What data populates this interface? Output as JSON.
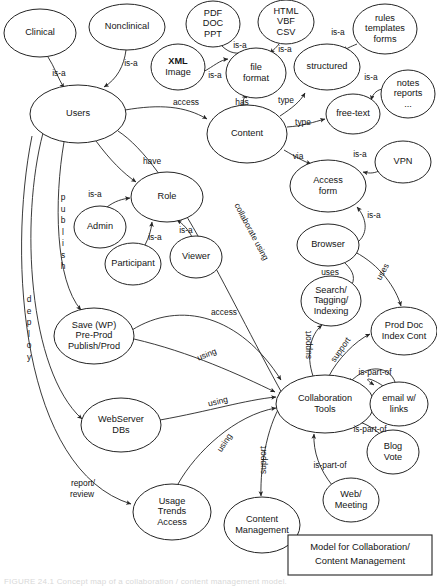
{
  "diagram": {
    "title": "Model for Collaboration/ Content Management",
    "caption_box": {
      "line1": "Model for Collaboration/",
      "line2": "Content Management"
    },
    "figure_caption": "FIGURE 24.1    Concept map of a collaboration / content management model.",
    "stroke_color": "#242424",
    "text_color": "#141414",
    "background_color": "#ffffff"
  },
  "nodes": [
    {
      "id": "clinical",
      "label": "Clinical",
      "lines": [
        "Clinical"
      ],
      "cx": 40,
      "cy": 33,
      "rx": 36,
      "ry": 24
    },
    {
      "id": "nonclinical",
      "label": "Nonclinical",
      "lines": [
        "Nonclinical"
      ],
      "cx": 127,
      "cy": 27,
      "rx": 38,
      "ry": 23
    },
    {
      "id": "pdf-doc-ppt",
      "label": "PDF DOC PPT",
      "lines": [
        "PDF",
        "DOC",
        "PPT"
      ],
      "cx": 213,
      "cy": 24,
      "rx": 27,
      "ry": 23
    },
    {
      "id": "html-vbf-csv",
      "label": "HTML VBF CSV",
      "lines": [
        "HTML",
        "VBF",
        "CSV"
      ],
      "cx": 286,
      "cy": 22,
      "rx": 28,
      "ry": 22
    },
    {
      "id": "rules-templates",
      "label": "rules templates forms",
      "lines": [
        "rules",
        "templates",
        "forms"
      ],
      "cx": 385,
      "cy": 29,
      "rx": 32,
      "ry": 25
    },
    {
      "id": "xml-image",
      "label": "XML Image",
      "lines": [
        "XML",
        "Image"
      ],
      "cx": 178,
      "cy": 67,
      "rx": 27,
      "ry": 23,
      "boldFirst": true
    },
    {
      "id": "file-format",
      "label": "file format",
      "lines": [
        "file",
        "format"
      ],
      "cx": 256,
      "cy": 73,
      "rx": 30,
      "ry": 25
    },
    {
      "id": "structured",
      "label": "structured",
      "lines": [
        "structured"
      ],
      "cx": 327,
      "cy": 67,
      "rx": 33,
      "ry": 23
    },
    {
      "id": "notes-reports",
      "label": "notes reports ...",
      "lines": [
        "notes",
        "reports",
        "..."
      ],
      "cx": 408,
      "cy": 94,
      "rx": 27,
      "ry": 24
    },
    {
      "id": "users",
      "label": "Users",
      "lines": [
        "Users"
      ],
      "cx": 78,
      "cy": 114,
      "rx": 48,
      "ry": 29
    },
    {
      "id": "content",
      "label": "Content",
      "lines": [
        "Content"
      ],
      "cx": 247,
      "cy": 134,
      "rx": 40,
      "ry": 29
    },
    {
      "id": "free-text",
      "label": "free-text",
      "lines": [
        "free-text"
      ],
      "cx": 353,
      "cy": 114,
      "rx": 27,
      "ry": 20
    },
    {
      "id": "vpn",
      "label": "VPN",
      "lines": [
        "VPN"
      ],
      "cx": 403,
      "cy": 162,
      "rx": 28,
      "ry": 21
    },
    {
      "id": "access-form",
      "label": "Access form",
      "lines": [
        "Access",
        "form"
      ],
      "cx": 328,
      "cy": 186,
      "rx": 38,
      "ry": 26
    },
    {
      "id": "role",
      "label": "Role",
      "lines": [
        "Role"
      ],
      "cx": 167,
      "cy": 197,
      "rx": 36,
      "ry": 25
    },
    {
      "id": "admin",
      "label": "Admin",
      "lines": [
        "Admin"
      ],
      "cx": 100,
      "cy": 227,
      "rx": 26,
      "ry": 21
    },
    {
      "id": "browser",
      "label": "Browser",
      "lines": [
        "Browser"
      ],
      "cx": 328,
      "cy": 245,
      "rx": 31,
      "ry": 21
    },
    {
      "id": "participant",
      "label": "Participant",
      "lines": [
        "Participant"
      ],
      "cx": 133,
      "cy": 264,
      "rx": 28,
      "ry": 21
    },
    {
      "id": "viewer",
      "label": "Viewer",
      "lines": [
        "Viewer"
      ],
      "cx": 196,
      "cy": 257,
      "rx": 26,
      "ry": 21
    },
    {
      "id": "search-tagging",
      "label": "Search/ Tagging/ Indexing",
      "lines": [
        "Search/",
        "Tagging/",
        "Indexing"
      ],
      "cx": 331,
      "cy": 301,
      "rx": 30,
      "ry": 25
    },
    {
      "id": "prod-doc-index",
      "label": "Prod Doc Index Cont",
      "lines": [
        "Prod Doc",
        "Index Cont"
      ],
      "cx": 404,
      "cy": 331,
      "rx": 33,
      "ry": 24
    },
    {
      "id": "save-wp",
      "label": "Save (WP) Pre-Prod Publish/Prod",
      "lines": [
        "Save (WP)",
        "Pre-Prod",
        "Publish/Prod"
      ],
      "cx": 94,
      "cy": 336,
      "rx": 40,
      "ry": 28
    },
    {
      "id": "collaboration",
      "label": "Collaboration Tools",
      "lines": [
        "Collaboration",
        "Tools"
      ],
      "cx": 325,
      "cy": 404,
      "rx": 49,
      "ry": 29
    },
    {
      "id": "email-links",
      "label": "email w/ links",
      "lines": [
        "email w/",
        "links"
      ],
      "cx": 399,
      "cy": 404,
      "rx": 29,
      "ry": 22
    },
    {
      "id": "webserver-dbs",
      "label": "WebServer DBs",
      "lines": [
        "WebServer",
        "DBs"
      ],
      "cx": 121,
      "cy": 425,
      "rx": 40,
      "ry": 27
    },
    {
      "id": "blog-vote",
      "label": "Blog Vote",
      "lines": [
        "Blog",
        "Vote"
      ],
      "cx": 393,
      "cy": 452,
      "rx": 26,
      "ry": 22
    },
    {
      "id": "web-meeting",
      "label": "Web/ Meeting",
      "lines": [
        "Web/",
        "Meeting"
      ],
      "cx": 351,
      "cy": 500,
      "rx": 28,
      "ry": 22
    },
    {
      "id": "usage-trends",
      "label": "Usage Trends Access",
      "lines": [
        "Usage",
        "Trends",
        "Access"
      ],
      "cx": 172,
      "cy": 512,
      "rx": 39,
      "ry": 28
    },
    {
      "id": "content-mgmt",
      "label": "Content Management",
      "lines": [
        "Content",
        "Management"
      ],
      "cx": 262,
      "cy": 525,
      "rx": 38,
      "ry": 28
    }
  ],
  "edges": [
    {
      "id": "clinical-users",
      "label": "is-a",
      "from": "clinical",
      "to": "users"
    },
    {
      "id": "nonclinical-users",
      "label": "is-a",
      "from": "nonclinical",
      "to": "users"
    },
    {
      "id": "pdf-fileformat",
      "label": "is-a",
      "from": "pdf-doc-ppt",
      "to": "file-format"
    },
    {
      "id": "html-fileformat",
      "label": "is-a",
      "from": "html-vbf-csv",
      "to": "file-format"
    },
    {
      "id": "xml-fileformat",
      "label": "is-a",
      "from": "xml-image",
      "to": "file-format"
    },
    {
      "id": "rules-structured",
      "label": "is-a",
      "from": "rules-templates",
      "to": "structured"
    },
    {
      "id": "notes-freetext",
      "label": "is-a",
      "from": "notes-reports",
      "to": "free-text"
    },
    {
      "id": "users-content",
      "label": "access",
      "from": "users",
      "to": "content"
    },
    {
      "id": "content-fileformat",
      "label": "has",
      "from": "content",
      "to": "file-format"
    },
    {
      "id": "content-structured",
      "label": "type",
      "from": "content",
      "to": "structured"
    },
    {
      "id": "content-freetext",
      "label": "type",
      "from": "content",
      "to": "free-text"
    },
    {
      "id": "content-accessform",
      "label": "via",
      "from": "content",
      "to": "access-form"
    },
    {
      "id": "vpn-accessform",
      "label": "is-a",
      "from": "vpn",
      "to": "access-form"
    },
    {
      "id": "browser-accessform",
      "label": "is-a",
      "from": "browser",
      "to": "access-form"
    },
    {
      "id": "users-role",
      "label": "have",
      "from": "users",
      "to": "role"
    },
    {
      "id": "admin-role",
      "label": "is-a",
      "from": "admin",
      "to": "role"
    },
    {
      "id": "participant-role",
      "label": "is-a",
      "from": "participant",
      "to": "role"
    },
    {
      "id": "viewer-role",
      "label": "is-a",
      "from": "viewer",
      "to": "role"
    },
    {
      "id": "users-collab",
      "label": "collaborate using",
      "from": "users",
      "to": "collaboration"
    },
    {
      "id": "users-savewp",
      "label": "publish",
      "from": "users",
      "to": "save-wp"
    },
    {
      "id": "users-webserver",
      "label": "deploy",
      "from": "users",
      "to": "webserver-dbs"
    },
    {
      "id": "users-usagetrends",
      "label": "report/ review",
      "from": "users",
      "to": "usage-trends"
    },
    {
      "id": "savewp-collab",
      "label": "using",
      "from": "save-wp",
      "to": "collaboration"
    },
    {
      "id": "savewp-collab-access",
      "label": "access",
      "from": "save-wp",
      "to": "collaboration"
    },
    {
      "id": "webserver-collab",
      "label": "using",
      "from": "webserver-dbs",
      "to": "collaboration"
    },
    {
      "id": "usage-collab",
      "label": "using",
      "from": "usage-trends",
      "to": "collaboration"
    },
    {
      "id": "browser-search",
      "label": "uses",
      "from": "browser",
      "to": "search-tagging"
    },
    {
      "id": "browser-proddoc",
      "label": "uses",
      "from": "browser",
      "to": "prod-doc-index"
    },
    {
      "id": "collab-search",
      "label": "support",
      "from": "collaboration",
      "to": "search-tagging"
    },
    {
      "id": "collab-proddoc",
      "label": "support",
      "from": "collaboration",
      "to": "prod-doc-index"
    },
    {
      "id": "collab-contentmgmt",
      "label": "support",
      "from": "collaboration",
      "to": "content-mgmt"
    },
    {
      "id": "email-collab",
      "label": "is-part-of",
      "from": "email-links",
      "to": "collaboration"
    },
    {
      "id": "blog-collab",
      "label": "is-part-of",
      "from": "blog-vote",
      "to": "collaboration"
    },
    {
      "id": "webmeeting-collab",
      "label": "is-part-of",
      "from": "web-meeting",
      "to": "collaboration"
    }
  ],
  "edge_labels": [
    {
      "id": "lbl-clinical-isa",
      "text": "is-a",
      "x": 59,
      "y": 74,
      "rotate": 0
    },
    {
      "id": "lbl-nonclinical-isa",
      "text": "is-a",
      "x": 131,
      "y": 64,
      "rotate": 0
    },
    {
      "id": "lbl-pdf-isa",
      "text": "is-a",
      "x": 240,
      "y": 46,
      "rotate": 0
    },
    {
      "id": "lbl-html-isa",
      "text": "is-a",
      "x": 285,
      "y": 50,
      "rotate": 0
    },
    {
      "id": "lbl-xml-isa",
      "text": "is-a",
      "x": 215,
      "y": 76,
      "rotate": 0
    },
    {
      "id": "lbl-rules-isa",
      "text": "is-a",
      "x": 338,
      "y": 33,
      "rotate": 0
    },
    {
      "id": "lbl-notes-isa",
      "text": "is-a",
      "x": 371,
      "y": 78,
      "rotate": 0
    },
    {
      "id": "lbl-access",
      "text": "access",
      "x": 186,
      "y": 103,
      "rotate": 0
    },
    {
      "id": "lbl-has",
      "text": "has",
      "x": 242,
      "y": 103,
      "rotate": 0
    },
    {
      "id": "lbl-type-structured",
      "text": "type",
      "x": 286,
      "y": 101,
      "rotate": 0
    },
    {
      "id": "lbl-type-freetext",
      "text": "type",
      "x": 303,
      "y": 123,
      "rotate": 0
    },
    {
      "id": "lbl-via",
      "text": "via",
      "x": 298,
      "y": 157,
      "rotate": 0
    },
    {
      "id": "lbl-vpn-isa",
      "text": "is-a",
      "x": 360,
      "y": 155,
      "rotate": 0
    },
    {
      "id": "lbl-browser-isa",
      "text": "is-a",
      "x": 374,
      "y": 216,
      "rotate": 0
    },
    {
      "id": "lbl-have",
      "text": "have",
      "x": 152,
      "y": 162,
      "rotate": 0
    },
    {
      "id": "lbl-admin-isa",
      "text": "is-a",
      "x": 95,
      "y": 195,
      "rotate": 0
    },
    {
      "id": "lbl-participant-isa",
      "text": "is-a",
      "x": 155,
      "y": 238,
      "rotate": 0
    },
    {
      "id": "lbl-viewer-isa",
      "text": "is-a",
      "x": 186,
      "y": 231,
      "rotate": 0
    },
    {
      "id": "lbl-collab-using",
      "text": "collaborate using",
      "x": 251,
      "y": 232,
      "rotate": 62
    },
    {
      "id": "lbl-access2",
      "text": "access",
      "x": 224,
      "y": 313,
      "rotate": 0
    },
    {
      "id": "lbl-uses-search",
      "text": "uses",
      "x": 330,
      "y": 273,
      "rotate": 0
    },
    {
      "id": "lbl-uses-proddoc",
      "text": "uses",
      "x": 383,
      "y": 272,
      "rotate": -62
    },
    {
      "id": "lbl-support-search",
      "text": "support",
      "x": 309,
      "y": 345,
      "rotate": -90
    },
    {
      "id": "lbl-support-proddoc",
      "text": "support",
      "x": 341,
      "y": 350,
      "rotate": -55
    },
    {
      "id": "lbl-using-savewp",
      "text": "using",
      "x": 207,
      "y": 355,
      "rotate": -22
    },
    {
      "id": "lbl-using-webserver",
      "text": "using",
      "x": 218,
      "y": 402,
      "rotate": -14
    },
    {
      "id": "lbl-using-usage",
      "text": "using",
      "x": 225,
      "y": 443,
      "rotate": -56
    },
    {
      "id": "lbl-ispartof-email",
      "text": "is-part-of",
      "x": 375,
      "y": 373,
      "rotate": 0
    },
    {
      "id": "lbl-ispartof-blog",
      "text": "is-part-of",
      "x": 370,
      "y": 430,
      "rotate": 0
    },
    {
      "id": "lbl-ispartof-web",
      "text": "is-part-of",
      "x": 330,
      "y": 466,
      "rotate": 0
    },
    {
      "id": "lbl-support-cm",
      "text": "support",
      "x": 264,
      "y": 460,
      "rotate": -90
    },
    {
      "id": "lbl-report-review-1",
      "text": "report/",
      "x": 83,
      "y": 484,
      "rotate": 0
    },
    {
      "id": "lbl-report-review-2",
      "text": "review",
      "x": 82,
      "y": 495,
      "rotate": 0
    }
  ],
  "vertical_labels": [
    {
      "id": "vlbl-publish",
      "text": "publish",
      "x": 63,
      "y": 198,
      "spacing": 11.5
    },
    {
      "id": "vlbl-deploy",
      "text": "deploy",
      "x": 29,
      "y": 300,
      "spacing": 11.5
    }
  ]
}
